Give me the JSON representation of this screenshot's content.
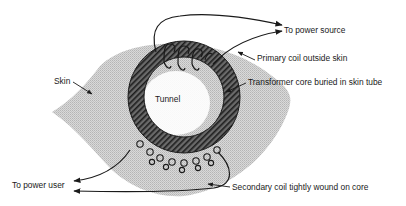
{
  "diagram": {
    "type": "illustration",
    "labels": {
      "skin": "Skin",
      "tunnel": "Tunnel",
      "to_power_source": "To power source",
      "primary_coil": "Primary coil outside skin",
      "transformer_core": "Transformer core buried in skin tube",
      "to_power_user": "To power user",
      "secondary_coil": "Secondary coil tightly wound on core"
    },
    "colors": {
      "skin_fill": "#cfcfcf",
      "core_fill": "#4a4a4a",
      "line": "#1a1a1a",
      "background": "#ffffff"
    },
    "components": [
      {
        "id": "skin",
        "label": "Skin"
      },
      {
        "id": "core",
        "label": "Transformer core buried in skin tube"
      },
      {
        "id": "tunnel",
        "label": "Tunnel"
      },
      {
        "id": "primary-coil",
        "label": "Primary coil outside skin",
        "connects_to": "To power source"
      },
      {
        "id": "secondary-coil",
        "label": "Secondary coil tightly wound on core",
        "connects_to": "To power user"
      }
    ]
  }
}
